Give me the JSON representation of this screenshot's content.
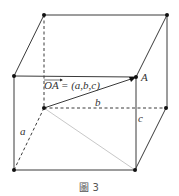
{
  "figure": {
    "caption": "圖 3",
    "vector_label": "OA→= (a,b,c)",
    "vector_name": "OA",
    "vector_components": "= (a,b,c)",
    "point_A": "A",
    "edge_a": "a",
    "edge_b": "b",
    "edge_c": "c"
  }
}
